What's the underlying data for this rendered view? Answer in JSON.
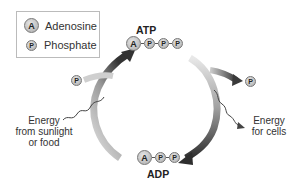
{
  "legend": {
    "items": [
      {
        "symbol": "A",
        "label": "Adenosine"
      },
      {
        "symbol": "P",
        "label": "Phosphate"
      }
    ]
  },
  "atp": {
    "title": "ATP",
    "chain": [
      "A",
      "P",
      "P",
      "P"
    ]
  },
  "adp": {
    "title": "ADP",
    "chain": [
      "A",
      "P",
      "P"
    ]
  },
  "left": {
    "phosphate": "P",
    "energy_label": [
      "Energy",
      "from sunlight",
      "or food"
    ]
  },
  "right": {
    "phosphate": "P",
    "energy_label": [
      "Energy",
      "for cells"
    ]
  },
  "colors": {
    "arrow_dark": "#3a3a3a",
    "arrow_light": "#d8d8d8",
    "molecule": "#bdbdbd"
  }
}
